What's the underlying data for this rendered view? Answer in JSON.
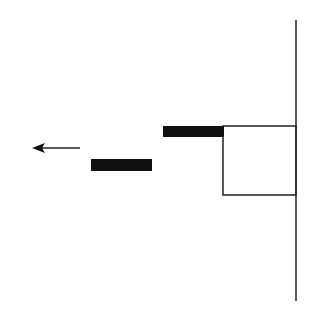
{
  "diagram": {
    "colors": {
      "background": "#ffffff",
      "stroke": "#222222",
      "fill": "#111111"
    },
    "wall": {
      "x": 296,
      "y1": 20,
      "y2": 301
    },
    "box": {
      "x": 223,
      "y": 126,
      "width": 73,
      "height": 69
    },
    "bars": [
      {
        "name": "upper-bar",
        "x": 163,
        "y": 126,
        "width": 61,
        "height": 11
      },
      {
        "name": "lower-bar",
        "x": 91,
        "y": 159,
        "width": 61,
        "height": 12
      }
    ],
    "arrow": {
      "x1": 80,
      "x2": 32,
      "y": 148,
      "direction": "left"
    }
  }
}
